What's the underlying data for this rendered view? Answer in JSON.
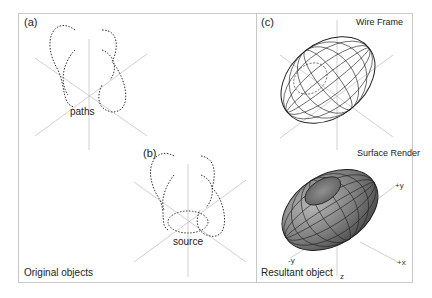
{
  "panels": {
    "a": {
      "tag": "(a)",
      "annotation": "paths"
    },
    "b": {
      "tag": "(b)",
      "annotation": "source"
    },
    "c": {
      "tag": "(c)",
      "wire_label": "Wire Frame",
      "surface_label": "Surface Render",
      "axis_labels": {
        "y": "+y",
        "neg_y": "-y",
        "x": "+x",
        "z": "z"
      }
    }
  },
  "captions": {
    "left": "Original objects",
    "right": "Resultant object"
  },
  "colors": {
    "axis": "#bdbdbd",
    "path": "#333333",
    "border": "#c8c8c8",
    "surface": "#7a7a7a"
  }
}
